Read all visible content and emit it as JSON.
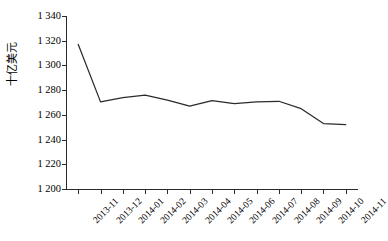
{
  "chart_data": {
    "type": "line",
    "title": "",
    "xlabel": "",
    "ylabel": "十亿美元",
    "categories": [
      "2013-11",
      "2013-12",
      "2014-01",
      "2014-02",
      "2014-03",
      "2014-04",
      "2014-05",
      "2014-06",
      "2014-07",
      "2014-08",
      "2014-09",
      "2014-10",
      "2014-11"
    ],
    "values": [
      1317,
      1270.5,
      1274,
      1276,
      1272,
      1267,
      1271.5,
      1269,
      1270.5,
      1271,
      1265,
      1253,
      1252
    ],
    "series": [
      {
        "name": "",
        "values": [
          1317,
          1270.5,
          1274,
          1276,
          1272,
          1267,
          1271.5,
          1269,
          1270.5,
          1271,
          1265,
          1253,
          1252
        ]
      }
    ],
    "ylim": [
      1200,
      1340
    ],
    "yticks": [
      1340,
      1320,
      1300,
      1280,
      1260,
      1240,
      1220,
      1200
    ],
    "ytick_labels": [
      "1 340",
      "1 320",
      "1 300",
      "1 280",
      "1 260",
      "1 240",
      "1 220",
      "1 200"
    ],
    "grid": false,
    "legend": false,
    "line_color": "#2b2b2b",
    "axis_color": "#2b2b2b",
    "markers": false
  },
  "axes": {
    "y_title": "十亿美元"
  }
}
